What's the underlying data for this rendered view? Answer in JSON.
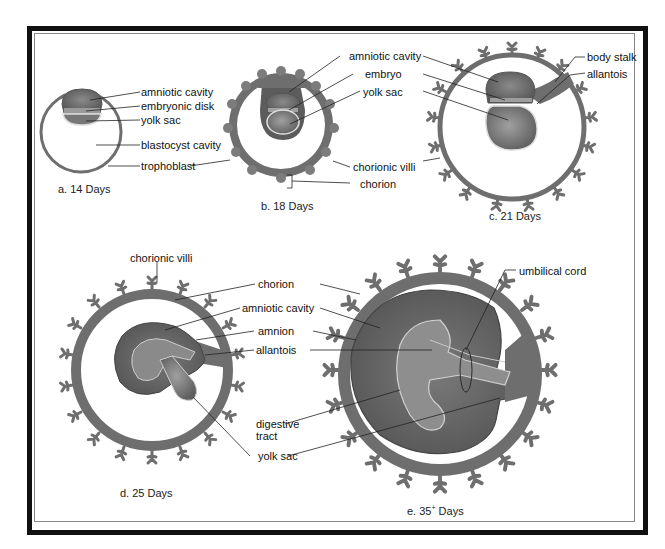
{
  "figure": {
    "panels": [
      {
        "id": "a",
        "caption": "a.  14 Days",
        "labels": [
          "amniotic cavity",
          "embryonic disk",
          "yolk sac",
          "blastocyst cavity",
          "trophoblast"
        ]
      },
      {
        "id": "b",
        "caption": "b.  18 Days",
        "labels": [
          "amniotic cavity",
          "embryo",
          "yolk sac",
          "chorionic villi",
          "chorion"
        ]
      },
      {
        "id": "c",
        "caption": "c.  21 Days",
        "labels": [
          "body stalk",
          "allantois"
        ]
      },
      {
        "id": "d",
        "caption": "d.  25 Days",
        "labels": [
          "chorionic villi",
          "chorion",
          "amniotic cavity",
          "amnion",
          "allantois",
          "digestive",
          "tract",
          "yolk sac"
        ]
      },
      {
        "id": "e",
        "caption_prefix": "e.  35",
        "caption_sup": "+",
        "caption_suffix": " Days",
        "labels": [
          "umbilical cord"
        ]
      }
    ]
  },
  "colors": {
    "chorion": "#6e6e6e",
    "amniotic": "#5e5e5e",
    "embryo": "#8c8c8c",
    "yolk": "#7a7a7a",
    "highlight": "#d8d8d8",
    "frame": "#111111"
  }
}
